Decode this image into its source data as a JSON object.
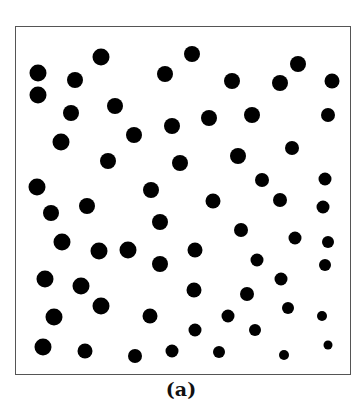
{
  "figure": {
    "caption": "(a)",
    "frame": {
      "x": 15,
      "y": 26,
      "width": 336,
      "height": 349,
      "border_color": "#555555"
    },
    "dot_color": "#000000",
    "dots": [
      {
        "x": 38,
        "y": 73,
        "r": 8.5
      },
      {
        "x": 38,
        "y": 95,
        "r": 8.5
      },
      {
        "x": 75,
        "y": 80,
        "r": 8
      },
      {
        "x": 101,
        "y": 57,
        "r": 8.5
      },
      {
        "x": 165,
        "y": 74,
        "r": 8
      },
      {
        "x": 192,
        "y": 54,
        "r": 8
      },
      {
        "x": 232,
        "y": 81,
        "r": 8
      },
      {
        "x": 280,
        "y": 83,
        "r": 8
      },
      {
        "x": 298,
        "y": 64,
        "r": 8
      },
      {
        "x": 332,
        "y": 81,
        "r": 7.5
      },
      {
        "x": 71,
        "y": 113,
        "r": 8
      },
      {
        "x": 115,
        "y": 106,
        "r": 8
      },
      {
        "x": 134,
        "y": 135,
        "r": 8
      },
      {
        "x": 172,
        "y": 126,
        "r": 8
      },
      {
        "x": 209,
        "y": 118,
        "r": 8
      },
      {
        "x": 252,
        "y": 115,
        "r": 8
      },
      {
        "x": 328,
        "y": 115,
        "r": 7
      },
      {
        "x": 61,
        "y": 142,
        "r": 8.5
      },
      {
        "x": 108,
        "y": 161,
        "r": 8
      },
      {
        "x": 180,
        "y": 163,
        "r": 8
      },
      {
        "x": 238,
        "y": 156,
        "r": 8
      },
      {
        "x": 292,
        "y": 148,
        "r": 7
      },
      {
        "x": 37,
        "y": 187,
        "r": 8.5
      },
      {
        "x": 151,
        "y": 190,
        "r": 8
      },
      {
        "x": 262,
        "y": 180,
        "r": 7
      },
      {
        "x": 325,
        "y": 179,
        "r": 6.5
      },
      {
        "x": 51,
        "y": 213,
        "r": 8
      },
      {
        "x": 87,
        "y": 206,
        "r": 8
      },
      {
        "x": 213,
        "y": 201,
        "r": 7.5
      },
      {
        "x": 280,
        "y": 200,
        "r": 7
      },
      {
        "x": 323,
        "y": 207,
        "r": 6.5
      },
      {
        "x": 160,
        "y": 222,
        "r": 8
      },
      {
        "x": 241,
        "y": 230,
        "r": 7
      },
      {
        "x": 295,
        "y": 238,
        "r": 6.5
      },
      {
        "x": 328,
        "y": 242,
        "r": 6
      },
      {
        "x": 62,
        "y": 242,
        "r": 8.5
      },
      {
        "x": 99,
        "y": 251,
        "r": 8.5
      },
      {
        "x": 128,
        "y": 250,
        "r": 8.5
      },
      {
        "x": 195,
        "y": 250,
        "r": 7.5
      },
      {
        "x": 257,
        "y": 260,
        "r": 6.5
      },
      {
        "x": 325,
        "y": 265,
        "r": 6
      },
      {
        "x": 160,
        "y": 264,
        "r": 8
      },
      {
        "x": 45,
        "y": 279,
        "r": 8.5
      },
      {
        "x": 81,
        "y": 286,
        "r": 8.5
      },
      {
        "x": 194,
        "y": 290,
        "r": 7.5
      },
      {
        "x": 247,
        "y": 294,
        "r": 7
      },
      {
        "x": 281,
        "y": 279,
        "r": 6.5
      },
      {
        "x": 101,
        "y": 306,
        "r": 8.5
      },
      {
        "x": 54,
        "y": 317,
        "r": 8.5
      },
      {
        "x": 150,
        "y": 316,
        "r": 7.5
      },
      {
        "x": 228,
        "y": 316,
        "r": 6.5
      },
      {
        "x": 288,
        "y": 308,
        "r": 6
      },
      {
        "x": 322,
        "y": 316,
        "r": 5
      },
      {
        "x": 195,
        "y": 330,
        "r": 6.5
      },
      {
        "x": 255,
        "y": 330,
        "r": 6
      },
      {
        "x": 43,
        "y": 347,
        "r": 8.5
      },
      {
        "x": 85,
        "y": 351,
        "r": 7.5
      },
      {
        "x": 135,
        "y": 356,
        "r": 7
      },
      {
        "x": 172,
        "y": 351,
        "r": 6.5
      },
      {
        "x": 219,
        "y": 352,
        "r": 6
      },
      {
        "x": 284,
        "y": 355,
        "r": 5
      },
      {
        "x": 328,
        "y": 345,
        "r": 4.5
      }
    ]
  }
}
